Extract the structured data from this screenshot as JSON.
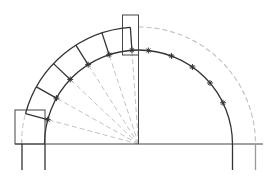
{
  "diagram": {
    "center": [
      138.5,
      144
    ],
    "inner_radius": 94,
    "outer_radius": 117,
    "voussoir_count": 6,
    "marker_count": 5,
    "colors": {
      "line": "#333333",
      "dashed": "#bbbbbb",
      "bg": "#ffffff"
    }
  }
}
